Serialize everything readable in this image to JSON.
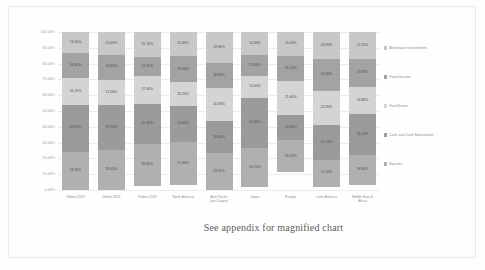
{
  "caption": "See appendix for magnified chart",
  "legend": {
    "items": [
      {
        "label": "Alternative Investments",
        "color": "#c8c8c8"
      },
      {
        "label": "Fixed Income",
        "color": "#a3a3a3"
      },
      {
        "label": "Real Estate",
        "color": "#d4d4d4"
      },
      {
        "label": "Cash and Cash Equivalents",
        "color": "#9b9b9b"
      },
      {
        "label": "Equities",
        "color": "#b0b0b0"
      }
    ]
  },
  "chart_data": {
    "type": "bar",
    "stacked": true,
    "title": "",
    "xlabel": "",
    "ylabel": "",
    "ylim": [
      0,
      100
    ],
    "grid": true,
    "legend_position": "right",
    "ytick_labels": [
      "100.00%",
      "90.00%",
      "80.00%",
      "70.00%",
      "60.00%",
      "50.00%",
      "40.00%",
      "30.00%",
      "20.00%",
      "10.00%",
      "0.00%"
    ],
    "ytick_values": [
      100,
      90,
      80,
      70,
      60,
      50,
      40,
      30,
      20,
      10,
      0
    ],
    "categories": [
      "Global 2010",
      "Global 2015",
      "Global 2018",
      "North America",
      "Asia Pacific\n(excl Japan)",
      "Japan",
      "Europe",
      "Latin America",
      "Middle East &\nAfrica"
    ],
    "series": [
      {
        "name": "Equities",
        "color": "#b0b0b0",
        "values": [
          24.3,
          26.6,
          26.9,
          27.4,
          23.1,
          24.7,
          20.2,
          17.1,
          18.9
        ],
        "labels": [
          "24.30%",
          "26.60%",
          "26.90%",
          "27.40%",
          "23.10%",
          "24.70%",
          "20.20%",
          "17.10%",
          "18.90%"
        ]
      },
      {
        "name": "Cash and Cash Equivalents",
        "color": "#9b9b9b",
        "values": [
          29.6,
          29.7,
          25.3,
          22.6,
          20.4,
          31.9,
          15.9,
          21.7,
          26.1
        ],
        "labels": [
          "29.60%",
          "29.70%",
          "25.30%",
          "22.60%",
          "20.40%",
          "31.90%",
          "15.90%",
          "21.70%",
          "26.10%"
        ]
      },
      {
        "name": "Real Estate",
        "color": "#d4d4d4",
        "values": [
          16.7,
          17.0,
          17.4,
          15.1,
          20.9,
          13.4,
          21.6,
          21.9,
          16.8
        ],
        "labels": [
          "16.70%",
          "17.00%",
          "17.40%",
          "15.10%",
          "20.90%",
          "13.40%",
          "21.60%",
          "21.90%",
          "16.80%"
        ]
      },
      {
        "name": "Fixed Income",
        "color": "#a3a3a3",
        "values": [
          16.4,
          16.6,
          12.2,
          16.6,
          16.0,
          13.8,
          16.1,
          20.3,
          17.9
        ],
        "labels": [
          "16.40%",
          "16.60%",
          "12.20%",
          "16.60%",
          "16.00%",
          "13.80%",
          "16.10%",
          "20.30%",
          "17.90%"
        ]
      },
      {
        "name": "Alternative Investments",
        "color": "#c8c8c8",
        "values": [
          13.0,
          15.0,
          15.7,
          15.3,
          19.6,
          14.3,
          15.0,
          16.9,
          17.1
        ],
        "labels": [
          "13.00%",
          "15.00%",
          "15.70%",
          "15.30%",
          "19.60%",
          "14.30%",
          "15.00%",
          "16.90%",
          "17.10%"
        ]
      }
    ]
  }
}
